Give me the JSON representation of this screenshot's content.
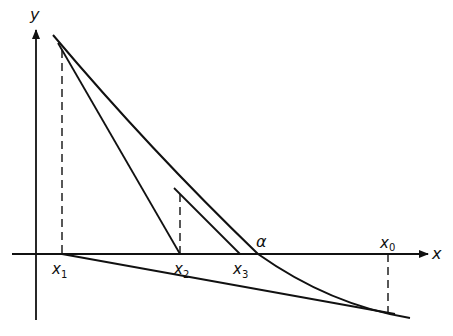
{
  "diagram": {
    "axes": {
      "x_label": "x",
      "y_label": "y"
    },
    "points": [
      {
        "name": "x0",
        "base": "x",
        "sub": "0"
      },
      {
        "name": "x1",
        "base": "x",
        "sub": "1"
      },
      {
        "name": "x2",
        "base": "x",
        "sub": "2"
      },
      {
        "name": "x3",
        "base": "x",
        "sub": "3"
      }
    ],
    "root_label": "α",
    "colors": {
      "line": "#111111",
      "background": "#ffffff"
    }
  }
}
